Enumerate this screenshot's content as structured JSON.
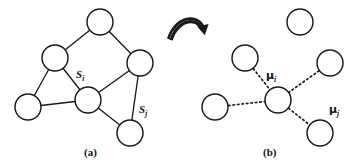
{
  "figure": {
    "width": 357,
    "height": 168,
    "background": "#ffffff",
    "ink_color": "#1a1a1a",
    "transition_arrow": {
      "name": "curved-right-arrow",
      "description": "hollow double-stroke curved arrow pointing from panel (a) to panel (b)"
    },
    "panels": [
      {
        "id": "a",
        "caption": "(a)",
        "caption_x": 84,
        "caption_y": 148,
        "edge_style": "solid",
        "nodes": [
          {
            "id": "n-top",
            "cx": 100,
            "cy": 22,
            "r": 13,
            "label": null
          },
          {
            "id": "n-upper-left",
            "cx": 55,
            "cy": 58,
            "r": 13,
            "label": null
          },
          {
            "id": "n-right",
            "cx": 140,
            "cy": 63,
            "r": 13,
            "label": null
          },
          {
            "id": "n-center",
            "cx": 88,
            "cy": 100,
            "r": 13,
            "label": "S_i"
          },
          {
            "id": "n-bottom-left",
            "cx": 28,
            "cy": 107,
            "r": 13,
            "label": null
          },
          {
            "id": "n-bottom-right",
            "cx": 130,
            "cy": 133,
            "r": 13,
            "label": "S_j"
          }
        ],
        "edges": [
          [
            "n-upper-left",
            "n-top"
          ],
          [
            "n-top",
            "n-right"
          ],
          [
            "n-upper-left",
            "n-bottom-left"
          ],
          [
            "n-upper-left",
            "n-center"
          ],
          [
            "n-center",
            "n-right"
          ],
          [
            "n-bottom-left",
            "n-center"
          ],
          [
            "n-center",
            "n-bottom-right"
          ],
          [
            "n-right",
            "n-bottom-right"
          ]
        ],
        "labels": [
          {
            "id": "label-si",
            "base": "S",
            "sub": "i",
            "x": 76,
            "y": 75,
            "greek": false
          },
          {
            "id": "label-sj",
            "base": "S",
            "sub": "j",
            "x": 139,
            "y": 110,
            "greek": false
          }
        ]
      },
      {
        "id": "b",
        "caption": "(b)",
        "caption_x": 263,
        "caption_y": 148,
        "edge_style": "dotted",
        "nodes": [
          {
            "id": "m-isolated",
            "cx": 300,
            "cy": 22,
            "r": 13,
            "label": null
          },
          {
            "id": "m-upper-left",
            "cx": 245,
            "cy": 58,
            "r": 13,
            "label": null
          },
          {
            "id": "m-right",
            "cx": 330,
            "cy": 63,
            "r": 13,
            "label": null
          },
          {
            "id": "m-center",
            "cx": 278,
            "cy": 100,
            "r": 13,
            "label": "mu_i"
          },
          {
            "id": "m-left",
            "cx": 215,
            "cy": 107,
            "r": 13,
            "label": null
          },
          {
            "id": "m-bottom-right",
            "cx": 320,
            "cy": 133,
            "r": 13,
            "label": "mu_j"
          }
        ],
        "edges": [
          [
            "m-upper-left",
            "m-center"
          ],
          [
            "m-right",
            "m-center"
          ],
          [
            "m-left",
            "m-center"
          ],
          [
            "m-center",
            "m-bottom-right"
          ]
        ],
        "labels": [
          {
            "id": "label-mu-i",
            "base": "μ",
            "sub": "i",
            "x": 266,
            "y": 76,
            "greek": true
          },
          {
            "id": "label-mu-j",
            "base": "μ",
            "sub": "j",
            "x": 329,
            "y": 110,
            "greek": true
          }
        ]
      }
    ]
  }
}
